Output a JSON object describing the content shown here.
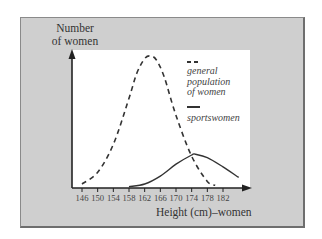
{
  "chart_data": {
    "type": "line",
    "title": "",
    "xlabel": "Height (cm)–women",
    "ylabel": "Number of women",
    "x_ticks": [
      146,
      150,
      154,
      158,
      162,
      166,
      170,
      174,
      178,
      182
    ],
    "xlim": [
      144,
      186
    ],
    "y_ticks": [],
    "grid": false,
    "legend_position": "upper right (inside plot)",
    "series": [
      {
        "name": "general population of women",
        "style": "dashed",
        "color": "#333333",
        "x": [
          146,
          150,
          154,
          158,
          160,
          162,
          163.5,
          165,
          167,
          170,
          174,
          178,
          180
        ],
        "y": [
          0.03,
          0.12,
          0.33,
          0.68,
          0.87,
          0.98,
          1.0,
          0.97,
          0.84,
          0.55,
          0.24,
          0.05,
          0.02
        ]
      },
      {
        "name": "sportswomen",
        "style": "solid",
        "color": "#333333",
        "x": [
          158,
          162,
          166,
          170,
          174,
          175,
          178,
          182,
          186
        ],
        "y": [
          0.01,
          0.03,
          0.09,
          0.18,
          0.25,
          0.255,
          0.23,
          0.16,
          0.08
        ]
      }
    ],
    "note": "Y-axis has no numeric scale; values are relative (peak of general population = 1.0)."
  },
  "labels": {
    "y_axis_line1": "Number",
    "y_axis_line2": "of women",
    "x_axis": "Height (cm)–women"
  },
  "legend": {
    "entries": [
      {
        "line1": "general",
        "line2": "population",
        "line3": "of women",
        "style": "dashed"
      },
      {
        "line1": "sportswomen",
        "style": "solid"
      }
    ]
  },
  "colors": {
    "panel": "#cfcfcf",
    "plot_background": "#ffffff",
    "ink": "#333333"
  }
}
